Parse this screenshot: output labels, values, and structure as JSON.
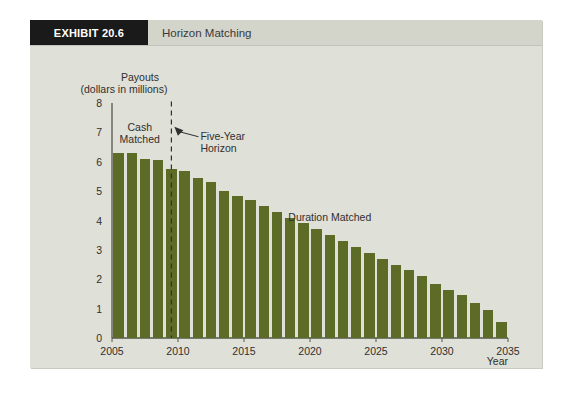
{
  "exhibit": {
    "badge_label": "EXHIBIT 20.6",
    "title": "Horizon Matching"
  },
  "colors": {
    "panel_bg": "#dfe0d7",
    "header_bg": "#d3d4ca",
    "badge_bg": "#1a1a1a",
    "bar": "#5c6b26",
    "axis": "#55564d",
    "text": "#2f2f2f"
  },
  "chart_data": {
    "type": "bar",
    "title": "Horizon Matching",
    "xlabel": "Year",
    "ylabel": "Payouts\n(dollars in millions)",
    "ylabel_line1": "Payouts",
    "ylabel_line2": "(dollars in millions)",
    "ylim": [
      0,
      8
    ],
    "ytick_values": [
      0,
      1,
      2,
      3,
      4,
      5,
      6,
      7,
      8
    ],
    "ytick_labels": [
      "0",
      "1",
      "2",
      "3",
      "4",
      "5",
      "6",
      "7",
      "8"
    ],
    "xlim": [
      2005,
      2035
    ],
    "xtick_values": [
      2005,
      2010,
      2015,
      2020,
      2025,
      2030,
      2035
    ],
    "xtick_labels": [
      "2005",
      "2010",
      "2015",
      "2020",
      "2025",
      "2030",
      "2035"
    ],
    "grid": false,
    "legend": false,
    "bar_color": "#5c6b26",
    "categories": [
      2005,
      2006,
      2007,
      2008,
      2009,
      2010,
      2011,
      2012,
      2013,
      2014,
      2015,
      2016,
      2017,
      2018,
      2019,
      2020,
      2021,
      2022,
      2023,
      2024,
      2025,
      2026,
      2027,
      2028,
      2029,
      2030,
      2031,
      2032,
      2033,
      2034
    ],
    "values": [
      6.3,
      6.3,
      6.1,
      6.05,
      5.75,
      5.7,
      5.45,
      5.3,
      5.0,
      4.85,
      4.7,
      4.5,
      4.3,
      4.1,
      3.9,
      3.7,
      3.5,
      3.3,
      3.1,
      2.9,
      2.7,
      2.5,
      2.3,
      2.1,
      1.85,
      1.65,
      1.45,
      1.2,
      0.95,
      0.55
    ],
    "annotations": [
      {
        "name": "cash-matched",
        "text_line1": "Cash",
        "text_line2": "Matched",
        "x": 2006.6,
        "y": 7.05
      },
      {
        "name": "five-year-horizon",
        "text_line1": "Five-Year",
        "text_line2": "Horizon",
        "x": 2011.2,
        "y": 6.75
      },
      {
        "name": "duration-matched",
        "text_line1": "Duration Matched",
        "x": 2021.0,
        "y": 4.0
      }
    ],
    "reference_line": {
      "name": "five-year-horizon-line",
      "x": 2009.0,
      "style": "dashed",
      "y_from": 0,
      "y_to": 8.05
    }
  }
}
